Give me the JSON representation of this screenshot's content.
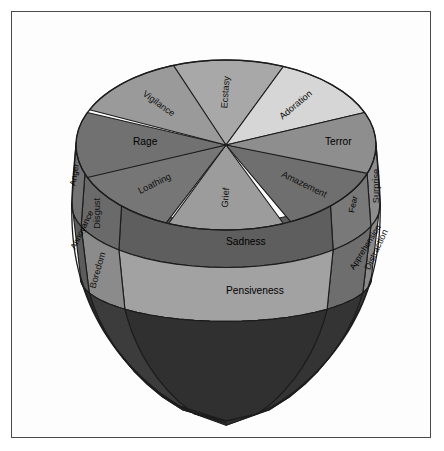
{
  "figure": {
    "frame_color": "#4a4a4a",
    "background_color": "#ffffff",
    "outline_color": "#1c1c1c"
  },
  "geometry": {
    "center_x": 226,
    "top_center_y": 145,
    "top_radius_x": 150,
    "top_radius_y": 85,
    "tip_y": 421,
    "band_boundaries_y": [
      145,
      205,
      278,
      345
    ],
    "sector_count": 8
  },
  "top_sectors": [
    {
      "id": "ecstasy",
      "label": "Ecstasy",
      "color": "#a8a8a8",
      "angle_deg": -90,
      "rotation": -86,
      "label_radius": 0.62,
      "size": "label"
    },
    {
      "id": "adoration",
      "label": "Adoration",
      "color": "#d6d6d6",
      "angle_deg": -45,
      "rotation": -40,
      "label_radius": 0.66,
      "size": "label"
    },
    {
      "id": "terror",
      "label": "Terror",
      "color": "#8e8e8e",
      "angle_deg": 0,
      "rotation": 0,
      "label_radius": 0.66,
      "size": "label-lg"
    },
    {
      "id": "amazement",
      "label": "Amazement",
      "color": "#6f6f6f",
      "angle_deg": 42,
      "rotation": 26,
      "label_radius": 0.7,
      "size": "label"
    },
    {
      "id": "grief",
      "label": "Grief",
      "color": "#9c9c9c",
      "angle_deg": 90,
      "rotation": -86,
      "label_radius": 0.62,
      "size": "label"
    },
    {
      "id": "loathing",
      "label": "Loathing",
      "color": "#767676",
      "angle_deg": 136,
      "rotation": -26,
      "label_radius": 0.66,
      "size": "label"
    },
    {
      "id": "rage",
      "label": "Rage",
      "color": "#717171",
      "angle_deg": 180,
      "rotation": 0,
      "label_radius": 0.62,
      "size": "label-lg"
    },
    {
      "id": "vigilance",
      "label": "Vigilance",
      "color": "#9a9a9a",
      "angle_deg": -133,
      "rotation": 36,
      "label_radius": 0.66,
      "size": "label"
    }
  ],
  "body_columns": [
    {
      "id": "surprise-col",
      "bands": [
        {
          "id": "surprise",
          "label": "Surprise",
          "color": "#8d8d8d",
          "rotation": -90,
          "size": "label"
        },
        {
          "id": "distraction",
          "label": "Distraction",
          "color": "#8a8a8a",
          "rotation": -65,
          "size": "label"
        },
        {
          "id": "unlabeled-surprise",
          "label": "",
          "color": "#3a3a3a",
          "rotation": 0,
          "size": "label"
        }
      ]
    },
    {
      "id": "fear-col",
      "bands": [
        {
          "id": "fear",
          "label": "Fear",
          "color": "#797979",
          "rotation": -78,
          "size": "label-sm"
        },
        {
          "id": "apprehension",
          "label": "Apprehension",
          "color": "#6e6e6e",
          "rotation": -58,
          "size": "label-sm"
        },
        {
          "id": "unlabeled-fear",
          "label": "",
          "color": "#343434",
          "rotation": 0,
          "size": "label"
        }
      ]
    },
    {
      "id": "sadness-col",
      "bands": [
        {
          "id": "sadness",
          "label": "Sadness",
          "color": "#5e5e5e",
          "rotation": 0,
          "size": "label-lg"
        },
        {
          "id": "pensiveness",
          "label": "Pensiveness",
          "color": "#a2a2a2",
          "rotation": 0,
          "size": "label-lg"
        },
        {
          "id": "unlabeled-sadness",
          "label": "",
          "color": "#303030",
          "rotation": 0,
          "size": "label"
        }
      ]
    },
    {
      "id": "disgust-col",
      "bands": [
        {
          "id": "disgust",
          "label": "Disgust",
          "color": "#6a6a6a",
          "rotation": -90,
          "size": "label"
        },
        {
          "id": "boredom",
          "label": "Boredom",
          "color": "#8b8b8b",
          "rotation": -74,
          "size": "label"
        },
        {
          "id": "unlabeled-disgust",
          "label": "",
          "color": "#3c3c3c",
          "rotation": 0,
          "size": "label"
        }
      ]
    },
    {
      "id": "anger-col",
      "bands": [
        {
          "id": "anger",
          "label": "Anger",
          "color": "#737373",
          "rotation": -80,
          "size": "label-sm"
        },
        {
          "id": "annoyance",
          "label": "Annoyance",
          "color": "#5c5c5c",
          "rotation": -64,
          "size": "label-sm"
        },
        {
          "id": "unlabeled-anger",
          "label": "",
          "color": "#2e2e2e",
          "rotation": 0,
          "size": "label"
        }
      ]
    }
  ],
  "emotion_index": {
    "primary_dyads_top": [
      "Ecstasy",
      "Adoration",
      "Terror",
      "Amazement",
      "Grief",
      "Loathing",
      "Rage",
      "Vigilance"
    ],
    "middle_intensity": [
      "Surprise",
      "Fear",
      "Sadness",
      "Disgust",
      "Anger"
    ],
    "low_intensity": [
      "Distraction",
      "Apprehension",
      "Pensiveness",
      "Boredom",
      "Annoyance"
    ]
  }
}
